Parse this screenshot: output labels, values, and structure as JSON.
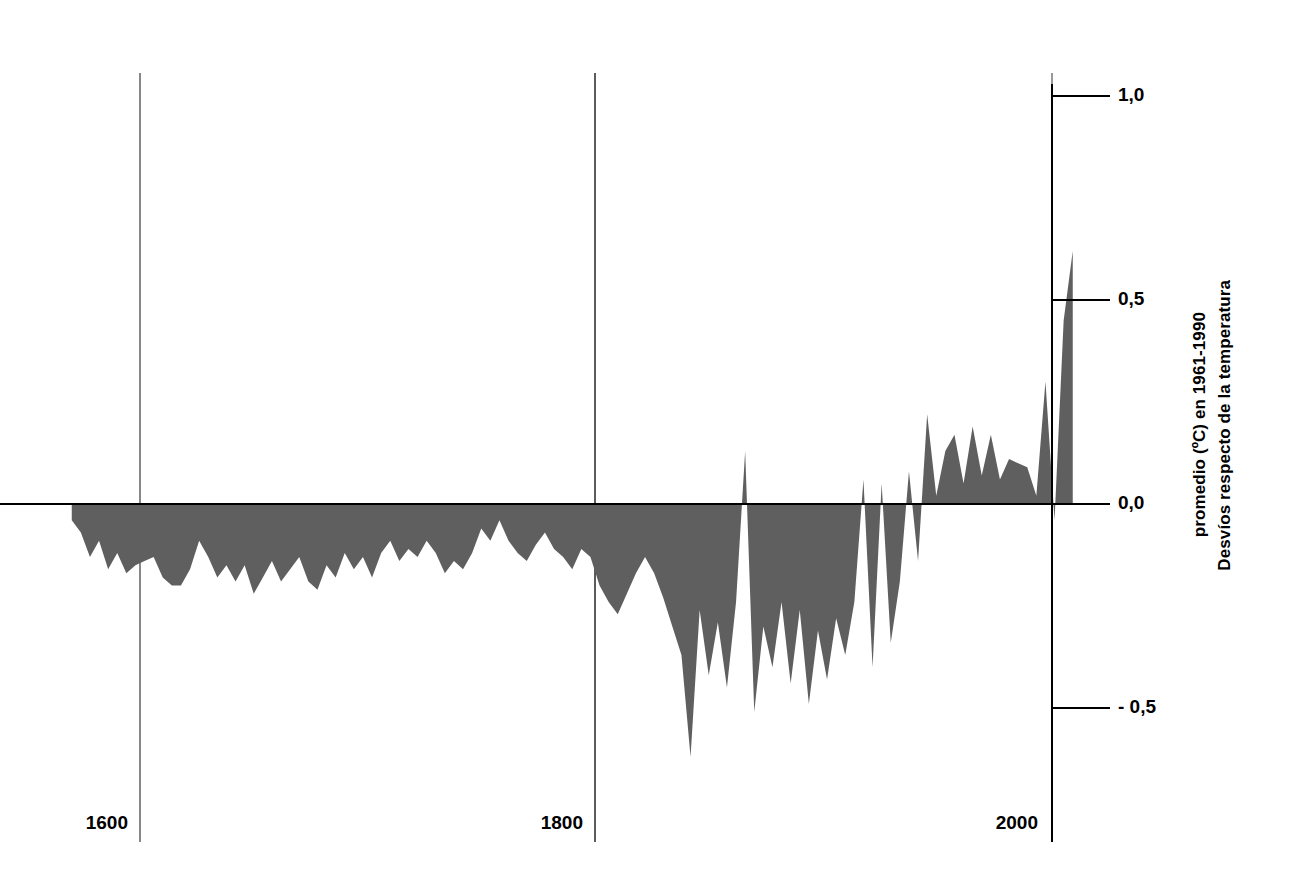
{
  "chart_data": {
    "type": "area",
    "title": "",
    "subtitle": "",
    "xlabel": "",
    "ylabel": "Desvíos respecto de la temperatura\npromedio (ºC) en 1961-1990",
    "ylabel_line1": "Desvíos respecto de la temperatura",
    "ylabel_line2": "promedio (ºC) en 1961-1990",
    "xlim": [
      1570,
      2012
    ],
    "ylim": [
      -0.72,
      1.05
    ],
    "grid": false,
    "legend": null,
    "baseline": 0.0,
    "fill_color": "#5f5f5f",
    "axis_color": "#000000",
    "gridline_color": "#5a5a5a",
    "background_color": "#ffffff",
    "x_ticks": [
      {
        "value": 1600,
        "label": "1600"
      },
      {
        "value": 1800,
        "label": "1800"
      },
      {
        "value": 2000,
        "label": "2000"
      }
    ],
    "y_ticks": [
      {
        "value": 1.0,
        "label": "1,0"
      },
      {
        "value": 0.5,
        "label": "0,5"
      },
      {
        "value": 0.0,
        "label": "0,0"
      },
      {
        "value": -0.5,
        "label": "- 0,5"
      }
    ],
    "series": [
      {
        "name": "Desvío de temperatura",
        "x": [
          1570,
          1574,
          1578,
          1582,
          1586,
          1590,
          1594,
          1598,
          1602,
          1606,
          1610,
          1614,
          1618,
          1622,
          1626,
          1630,
          1634,
          1638,
          1642,
          1646,
          1650,
          1654,
          1658,
          1662,
          1666,
          1670,
          1674,
          1678,
          1682,
          1686,
          1690,
          1694,
          1698,
          1702,
          1706,
          1710,
          1714,
          1718,
          1722,
          1726,
          1730,
          1734,
          1738,
          1742,
          1746,
          1750,
          1754,
          1758,
          1762,
          1766,
          1770,
          1774,
          1778,
          1782,
          1786,
          1790,
          1794,
          1798,
          1802,
          1806,
          1810,
          1814,
          1818,
          1822,
          1826,
          1830,
          1834,
          1838,
          1842,
          1846,
          1850,
          1854,
          1858,
          1862,
          1866,
          1870,
          1874,
          1878,
          1882,
          1886,
          1890,
          1894,
          1898,
          1902,
          1906,
          1910,
          1914,
          1918,
          1922,
          1926,
          1930,
          1934,
          1938,
          1942,
          1946,
          1950,
          1954,
          1958,
          1962,
          1966,
          1970,
          1974,
          1978,
          1982,
          1986,
          1990,
          1994,
          1998,
          2002,
          2006,
          2010
        ],
        "y": [
          -0.04,
          -0.07,
          -0.13,
          -0.09,
          -0.16,
          -0.12,
          -0.17,
          -0.15,
          -0.14,
          -0.13,
          -0.18,
          -0.2,
          -0.2,
          -0.16,
          -0.09,
          -0.13,
          -0.18,
          -0.15,
          -0.19,
          -0.15,
          -0.22,
          -0.18,
          -0.14,
          -0.19,
          -0.16,
          -0.13,
          -0.19,
          -0.21,
          -0.15,
          -0.18,
          -0.12,
          -0.16,
          -0.13,
          -0.18,
          -0.12,
          -0.09,
          -0.14,
          -0.11,
          -0.13,
          -0.09,
          -0.12,
          -0.17,
          -0.14,
          -0.16,
          -0.12,
          -0.06,
          -0.09,
          -0.04,
          -0.09,
          -0.12,
          -0.14,
          -0.1,
          -0.07,
          -0.11,
          -0.13,
          -0.16,
          -0.11,
          -0.13,
          -0.2,
          -0.24,
          -0.27,
          -0.22,
          -0.17,
          -0.13,
          -0.17,
          -0.23,
          -0.3,
          -0.37,
          -0.62,
          -0.26,
          -0.42,
          -0.29,
          -0.45,
          -0.24,
          0.13,
          -0.51,
          -0.3,
          -0.4,
          -0.24,
          -0.44,
          -0.26,
          -0.49,
          -0.31,
          -0.43,
          -0.28,
          -0.37,
          -0.24,
          0.06,
          -0.4,
          0.05,
          -0.34,
          -0.19,
          0.08,
          -0.14,
          0.22,
          0.02,
          0.13,
          0.17,
          0.05,
          0.19,
          0.07,
          0.17,
          0.06,
          0.11,
          0.1,
          0.09,
          0.02,
          0.3,
          -0.04,
          0.45,
          0.62
        ]
      }
    ]
  },
  "axes": {
    "right_axis_visible": true,
    "left_axis_visible": false,
    "top_axis_visible": false,
    "bottom_axis_visible": false,
    "zero_line_visible": true,
    "vertical_gridlines_visible": true
  }
}
